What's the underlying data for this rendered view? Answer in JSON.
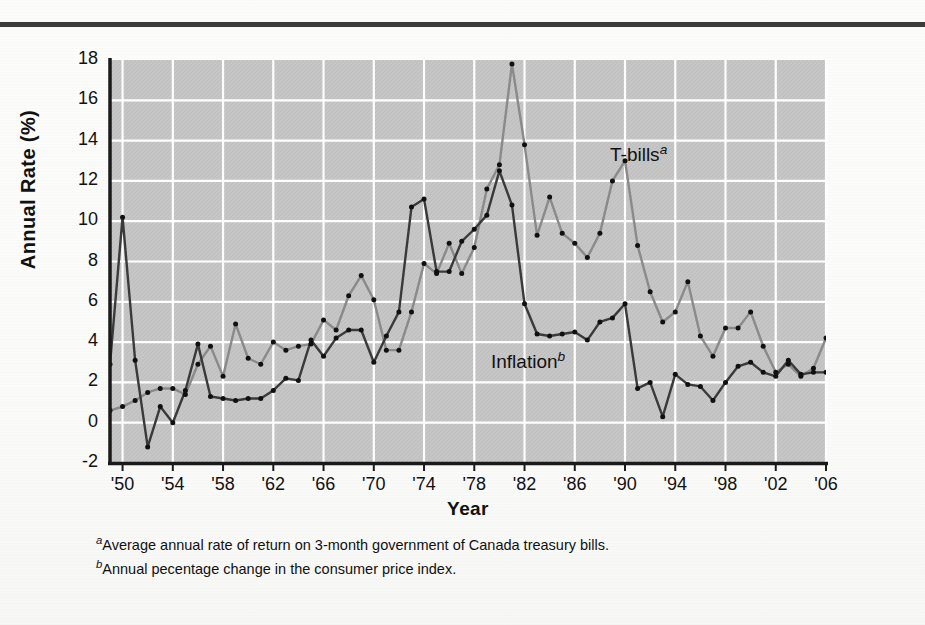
{
  "figure": {
    "y_axis_title": "Annual Rate (%)",
    "x_axis_title": "Year",
    "series_labels": {
      "tbills": "T-bills",
      "tbills_marker": "a",
      "inflation": "Inflation",
      "inflation_marker": "b"
    },
    "footnotes": [
      {
        "marker": "a",
        "text": "Average annual rate of return on 3-month government of Canada treasury bills."
      },
      {
        "marker": "b",
        "text": "Annual pecentage change in the consumer price index."
      }
    ],
    "colors": {
      "plot_background": "#c6c6c6",
      "grid": "#ffffff",
      "axis": "#1a1a1a",
      "tbills_line": "#8a8a8a",
      "inflation_line": "#3a3a3a",
      "marker": "#101010",
      "top_rule": "#3c3c3c"
    }
  },
  "chart_data": {
    "type": "line",
    "title": "",
    "xlabel": "Year",
    "ylabel": "Annual Rate (%)",
    "xlim": [
      1949,
      2006
    ],
    "ylim": [
      -2,
      18
    ],
    "ytick_values": [
      -2,
      0,
      2,
      4,
      6,
      8,
      10,
      12,
      14,
      16,
      18
    ],
    "ytick_labels": [
      "-2",
      "0",
      "2",
      "4",
      "6",
      "8",
      "10",
      "12",
      "14",
      "16",
      "18"
    ],
    "xtick_values": [
      1950,
      1954,
      1958,
      1962,
      1966,
      1970,
      1974,
      1978,
      1982,
      1986,
      1990,
      1994,
      1998,
      2002,
      2006
    ],
    "xtick_labels": [
      "'50",
      "'54",
      "'58",
      "'62",
      "'66",
      "'70",
      "'74",
      "'78",
      "'82",
      "'86",
      "'90",
      "'94",
      "'98",
      "'02",
      "'06"
    ],
    "grid": true,
    "legend_position": "inline-annotation",
    "x": [
      1949,
      1950,
      1951,
      1952,
      1953,
      1954,
      1955,
      1956,
      1957,
      1958,
      1959,
      1960,
      1961,
      1962,
      1963,
      1964,
      1965,
      1966,
      1967,
      1968,
      1969,
      1970,
      1971,
      1972,
      1973,
      1974,
      1975,
      1976,
      1977,
      1978,
      1979,
      1980,
      1981,
      1982,
      1983,
      1984,
      1985,
      1986,
      1987,
      1988,
      1989,
      1990,
      1991,
      1992,
      1993,
      1994,
      1995,
      1996,
      1997,
      1998,
      1999,
      2000,
      2001,
      2002,
      2003,
      2004,
      2005,
      2006
    ],
    "series": [
      {
        "name": "T-bills",
        "footnote": "a",
        "color": "#8a8a8a",
        "values": [
          0.6,
          0.8,
          1.1,
          1.5,
          1.7,
          1.7,
          1.4,
          2.9,
          3.8,
          2.3,
          4.9,
          3.2,
          2.9,
          4.0,
          3.6,
          3.8,
          3.9,
          5.1,
          4.6,
          6.3,
          7.3,
          6.1,
          3.6,
          3.6,
          5.5,
          7.9,
          7.4,
          8.9,
          7.4,
          8.7,
          11.6,
          12.8,
          17.8,
          13.8,
          9.3,
          11.2,
          9.4,
          8.9,
          8.2,
          9.4,
          12.0,
          13.0,
          8.8,
          6.5,
          5.0,
          5.5,
          7.0,
          4.3,
          3.3,
          4.7,
          4.7,
          5.5,
          3.8,
          2.5,
          2.9,
          2.3,
          2.7,
          4.2
        ]
      },
      {
        "name": "Inflation",
        "footnote": "b",
        "color": "#3a3a3a",
        "values": [
          2.9,
          10.2,
          3.1,
          -1.2,
          0.8,
          0.0,
          1.6,
          3.9,
          1.3,
          1.2,
          1.1,
          1.2,
          1.2,
          1.6,
          2.2,
          2.1,
          4.1,
          3.3,
          4.2,
          4.6,
          4.6,
          3.0,
          4.3,
          5.5,
          10.7,
          11.1,
          7.5,
          7.5,
          9.0,
          9.6,
          10.3,
          12.5,
          10.8,
          5.9,
          4.4,
          4.3,
          4.4,
          4.5,
          4.1,
          5.0,
          5.2,
          5.9,
          1.7,
          2.0,
          0.3,
          2.4,
          1.9,
          1.8,
          1.1,
          2.0,
          2.8,
          3.0,
          2.5,
          2.3,
          3.1,
          2.4,
          2.5,
          2.5
        ]
      }
    ]
  }
}
